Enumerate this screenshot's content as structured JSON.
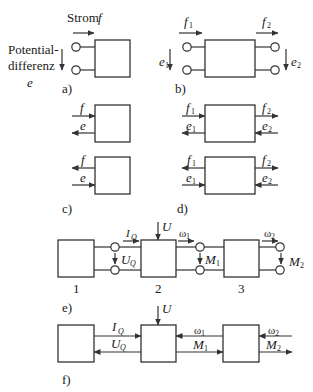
{
  "figure": {
    "panels": {
      "a": {
        "label": "a)",
        "flow_label": "Strom",
        "flow_symbol": "f",
        "effort_label_line1": "Potential-",
        "effort_label_line2": "differenz",
        "effort_symbol": "e"
      },
      "b": {
        "label": "b)",
        "f1": "f",
        "f1_sub": "1",
        "f2": "f",
        "f2_sub": "2",
        "e1": "e",
        "e1_sub": "1",
        "e2": "e",
        "e2_sub": "2"
      },
      "c": {
        "label": "c)",
        "upper": {
          "f": "f",
          "e": "e"
        },
        "lower": {
          "f": "f",
          "e": "e"
        }
      },
      "d": {
        "label": "d)",
        "upper": {
          "f1": "f",
          "f1_sub": "1",
          "f2": "f",
          "f2_sub": "2",
          "e1": "e",
          "e1_sub": "1",
          "e2": "e",
          "e2_sub": "2"
        },
        "lower": {
          "f1": "f",
          "f1_sub": "1",
          "f2": "f",
          "f2_sub": "2",
          "e1": "e",
          "e1_sub": "1",
          "e2": "e",
          "e2_sub": "2"
        }
      },
      "e": {
        "label": "e)",
        "input": "U",
        "current": "I",
        "current_sub": "Q",
        "voltage": "U",
        "voltage_sub": "Q",
        "omega1": "ω",
        "omega1_sub": "1",
        "torque1": "M",
        "torque1_sub": "1",
        "omega2": "ω",
        "omega2_sub": "2",
        "torque2": "M",
        "torque2_sub": "2",
        "block_numbers": [
          "1",
          "2",
          "3"
        ]
      },
      "f": {
        "label": "f)",
        "input": "U",
        "current": "I",
        "current_sub": "Q",
        "voltage": "U",
        "voltage_sub": "Q",
        "omega1": "ω",
        "omega1_sub": "1",
        "torque1": "M",
        "torque1_sub": "1",
        "omega2": "ω",
        "omega2_sub": "2",
        "torque2": "M",
        "torque2_sub": "2"
      }
    },
    "colors": {
      "line": "#333333",
      "text": "#1a1a1a",
      "background": "#ffffff"
    }
  }
}
